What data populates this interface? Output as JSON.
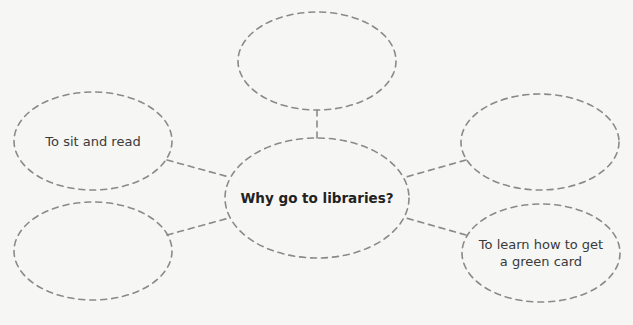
{
  "diagram": {
    "type": "concept-web",
    "stroke_color": "#8a8a8a",
    "background_color": "#f6f6f4",
    "center": {
      "label": "Why go to libraries?"
    },
    "nodes": [
      {
        "id": "top",
        "label": ""
      },
      {
        "id": "left",
        "label": "To sit and read"
      },
      {
        "id": "right",
        "label": ""
      },
      {
        "id": "bottom-left",
        "label": ""
      },
      {
        "id": "bottom-right",
        "label": "To learn how to get a green card"
      }
    ]
  }
}
